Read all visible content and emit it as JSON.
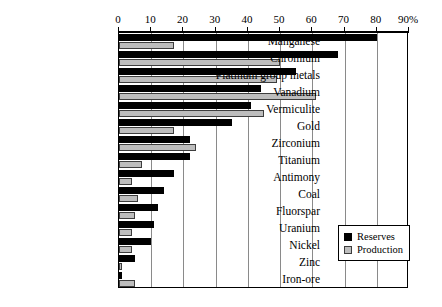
{
  "chart_data": {
    "type": "bar",
    "orientation": "horizontal",
    "title": "",
    "subtitle": "",
    "xlabel": "",
    "ylabel": "",
    "xlim": [
      0,
      90
    ],
    "grid": true,
    "legend_position": "bottom-right",
    "axis_suffix": "%",
    "tick_labels": [
      "0",
      "10",
      "20",
      "30",
      "40",
      "50",
      "60",
      "70",
      "80",
      "90%"
    ],
    "tick_values": [
      0,
      10,
      20,
      30,
      40,
      50,
      60,
      70,
      80,
      90
    ],
    "categories": [
      "Manganese",
      "Chromium",
      "Platinum group metals",
      "Vanadium",
      "Vermiculite",
      "Gold",
      "Zirconium",
      "Titanium",
      "Antimony",
      "Coal",
      "Fluorspar",
      "Uranium",
      "Nickel",
      "Zinc",
      "Iron-ore"
    ],
    "series": [
      {
        "name": "Reserves",
        "color": "#000000",
        "values": [
          80,
          68,
          55,
          44,
          41,
          35,
          22,
          22,
          17,
          14,
          12,
          11,
          10,
          5,
          1
        ]
      },
      {
        "name": "Production",
        "color": "#bdbdbd",
        "values": [
          17,
          50,
          49,
          61,
          45,
          17,
          24,
          7,
          4,
          6,
          5,
          4,
          4,
          1,
          5
        ]
      }
    ]
  },
  "legend": {
    "items": [
      {
        "label": "Reserves"
      },
      {
        "label": "Production"
      }
    ]
  }
}
